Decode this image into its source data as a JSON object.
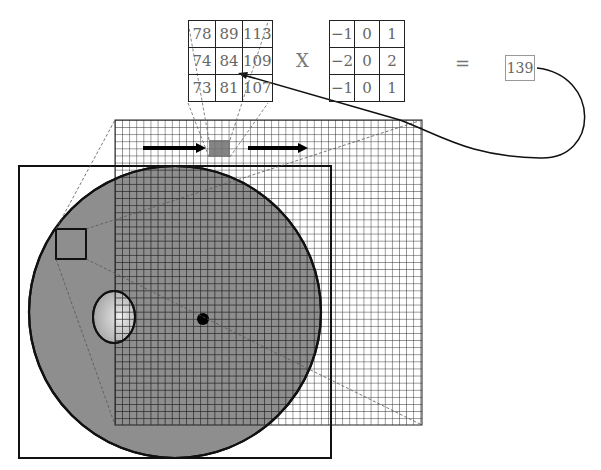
{
  "diagram": {
    "image_patch": {
      "rows": [
        [
          "78",
          "89",
          "113"
        ],
        [
          "74",
          "84",
          "109"
        ],
        [
          "73",
          "81",
          "107"
        ]
      ]
    },
    "operator_multiply": "X",
    "kernel": {
      "rows": [
        [
          "−1",
          "0",
          "1"
        ],
        [
          "−2",
          "0",
          "2"
        ],
        [
          "−1",
          "0",
          "1"
        ]
      ]
    },
    "operator_equals": "=",
    "result": "139",
    "annotations": {
      "arrow_from_result_to": "center pixel 84",
      "sliding_direction": "left-to-right",
      "grid": "pixel grid overlaid on fundus image",
      "features": [
        "fundus circle",
        "optic disc",
        "fovea dot",
        "zoom region box",
        "highlighted 3x3 window"
      ]
    },
    "colors": {
      "fundus_fill": "#8c8c8c",
      "grid_line": "#222222",
      "window_fill": "#777777",
      "optic_disc": "#b8b8b8"
    }
  }
}
